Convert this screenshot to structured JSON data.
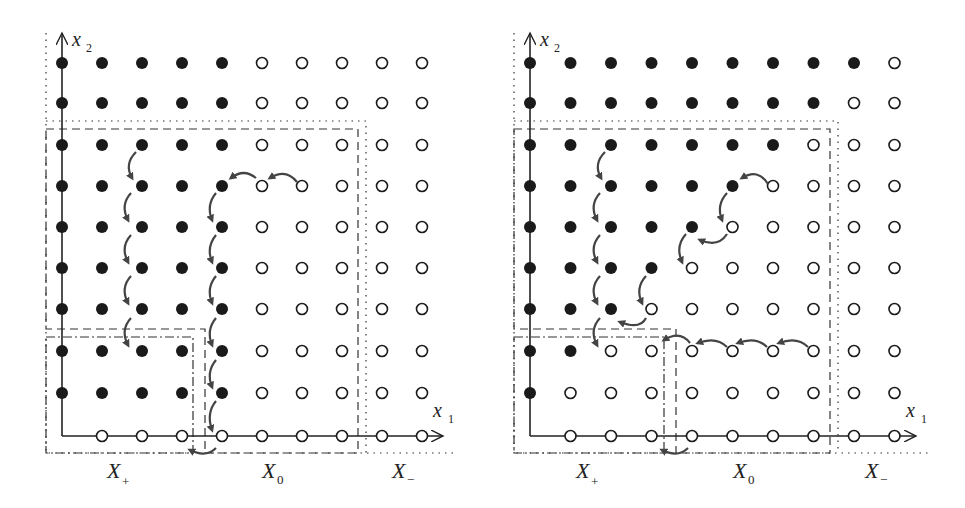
{
  "panels": [
    {
      "id": "left",
      "axis_labels": {
        "x": "x",
        "x_sub": "1",
        "y": "x",
        "y_sub": "2"
      },
      "region_labels": [
        {
          "main": "X",
          "sub": "+"
        },
        {
          "main": "X",
          "sub": "0"
        },
        {
          "main": "X",
          "sub": "−"
        }
      ],
      "grid_rows_top_to_bottom": [
        "FFFFFOOOOO",
        "FFFFFOOOOO",
        "FFFFFOOOOO",
        "FFFFFOOOOO",
        "FFFFFOOOOO",
        "FFFFFOOOOO",
        "FFFFFOOOOO",
        "FFFFFOOOOO",
        "FFFFFOOOOO",
        "-OOOOOOOOO"
      ]
    },
    {
      "id": "right",
      "axis_labels": {
        "x": "x",
        "x_sub": "1",
        "y": "x",
        "y_sub": "2"
      },
      "region_labels": [
        {
          "main": "X",
          "sub": "+"
        },
        {
          "main": "X",
          "sub": "0"
        },
        {
          "main": "X",
          "sub": "−"
        }
      ],
      "grid_rows_top_to_bottom": [
        "FFFFFFFFFO",
        "FFFFFFFFOO",
        "FFFFFFFOOO",
        "FFFFFFOOOO",
        "FFFFFOOOOO",
        "FFFFOOOOOO",
        "FFFOOOOOOO",
        "FFOOOOOOOO",
        "FOOOOOOOOO",
        "-OOOOOOOOO"
      ]
    }
  ],
  "legend": {
    "filled": "filled dot",
    "open": "open dot"
  },
  "colors": {
    "ink": "#1a1a1a",
    "arrow": "#444444"
  }
}
